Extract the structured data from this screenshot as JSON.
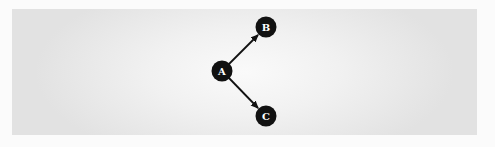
{
  "diagram": {
    "type": "directed-graph",
    "colors": {
      "node_fill": "#111111",
      "node_label": "#ffffff",
      "edge": "#111111",
      "panel": "#e8e8e8"
    },
    "nodes": [
      {
        "id": "A",
        "label": "A",
        "x": 222,
        "y": 71
      },
      {
        "id": "B",
        "label": "B",
        "x": 266,
        "y": 27
      },
      {
        "id": "C",
        "label": "C",
        "x": 266,
        "y": 116
      }
    ],
    "edges": [
      {
        "from": "A",
        "to": "B"
      },
      {
        "from": "A",
        "to": "C"
      }
    ]
  }
}
